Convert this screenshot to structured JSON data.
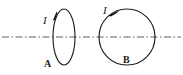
{
  "figure": {
    "type": "physics-diagram",
    "background_color": "#ffffff",
    "stroke_color": "#1f1f1f",
    "axis_color": "#5c5c66",
    "width": 183,
    "height": 75,
    "axis": {
      "name": "common-axis",
      "style": "dash-dot",
      "x_start": 2,
      "x_end": 181,
      "y": 37
    },
    "loops": [
      {
        "id": "A",
        "label": "A",
        "shape": "ellipse",
        "cx": 64,
        "cy": 37,
        "rx": 11,
        "ry": 28,
        "current_label": "I",
        "current_label_x": 43,
        "current_label_y": 24,
        "arrow_direction": "down-left",
        "arrow_x": 55,
        "arrow_y": 16,
        "loop_label_x": 44,
        "loop_label_y": 66
      },
      {
        "id": "B",
        "label": "B",
        "shape": "circle",
        "cx": 127,
        "cy": 37,
        "rx": 28,
        "ry": 28,
        "current_label": "I",
        "current_label_x": 103,
        "current_label_y": 14,
        "arrow_direction": "left-along-top",
        "arrow_x": 113,
        "arrow_y": 11,
        "loop_label_x": 123,
        "loop_label_y": 62
      }
    ],
    "labels": {
      "current_a": "I",
      "current_b": "I",
      "loop_a": "A",
      "loop_b": "B"
    }
  }
}
